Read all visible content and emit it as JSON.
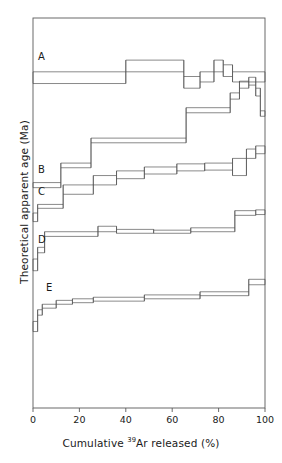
{
  "figure": {
    "title": "",
    "background": "#ffffff",
    "line_color": "#4a4a4a",
    "frame_color": "#5a5a5a"
  },
  "axes": {
    "x": {
      "label_prefix": "Cumulative ",
      "label_sup": "39",
      "label_suffix": "Ar released (%)",
      "label_full": "Cumulative 39Ar released (%)",
      "ticks": [
        "0",
        "20",
        "40",
        "60",
        "80",
        "100"
      ],
      "min": 0,
      "max": 100
    },
    "y": {
      "label": "Theoretical apparent age (Ma)",
      "ticks": [],
      "min": 0,
      "max": 1
    }
  },
  "spectrum_labels": [
    {
      "id": "A",
      "label": "A"
    },
    {
      "id": "B",
      "label": "B"
    },
    {
      "id": "C",
      "label": "C"
    },
    {
      "id": "D",
      "label": "D"
    },
    {
      "id": "E",
      "label": "E"
    }
  ],
  "chart_data": {
    "type": "line",
    "subtype": "ar-ar-age-spectrum-staircase",
    "title": "",
    "xlabel": "Cumulative 39Ar released (%)",
    "ylabel": "Theoretical apparent age (Ma)",
    "xlim": [
      0,
      100
    ],
    "ylim": [
      0,
      1
    ],
    "grid": false,
    "legend": "none",
    "annotations": [
      "A",
      "B",
      "C",
      "D",
      "E"
    ],
    "note": "Five theoretical staircase release spectra; each step drawn as a box with upper and lower error bounds. y values are normalized fractions of the plot height (0 = bottom axis, 1 = top axis).",
    "series": [
      {
        "name": "A",
        "label": "A",
        "steps": [
          {
            "x0": 0,
            "x1": 40,
            "y_low": 0.832,
            "y_high": 0.862
          },
          {
            "x0": 40,
            "x1": 65,
            "y_low": 0.862,
            "y_high": 0.892
          },
          {
            "x0": 65,
            "x1": 72,
            "y_low": 0.82,
            "y_high": 0.85
          },
          {
            "x0": 72,
            "x1": 78,
            "y_low": 0.836,
            "y_high": 0.862
          },
          {
            "x0": 78,
            "x1": 82,
            "y_low": 0.862,
            "y_high": 0.892
          },
          {
            "x0": 82,
            "x1": 86,
            "y_low": 0.85,
            "y_high": 0.88
          },
          {
            "x0": 86,
            "x1": 100,
            "y_low": 0.836,
            "y_high": 0.862
          }
        ]
      },
      {
        "name": "B",
        "label": "B",
        "steps": [
          {
            "x0": 0,
            "x1": 12,
            "y_low": 0.565,
            "y_high": 0.578
          },
          {
            "x0": 12,
            "x1": 25,
            "y_low": 0.616,
            "y_high": 0.628
          },
          {
            "x0": 25,
            "x1": 66,
            "y_low": 0.68,
            "y_high": 0.692
          },
          {
            "x0": 66,
            "x1": 85,
            "y_low": 0.757,
            "y_high": 0.77
          },
          {
            "x0": 85,
            "x1": 89,
            "y_low": 0.792,
            "y_high": 0.808
          },
          {
            "x0": 89,
            "x1": 93,
            "y_low": 0.82,
            "y_high": 0.838
          },
          {
            "x0": 93,
            "x1": 96,
            "y_low": 0.828,
            "y_high": 0.848
          },
          {
            "x0": 96,
            "x1": 98,
            "y_low": 0.8,
            "y_high": 0.82
          },
          {
            "x0": 98,
            "x1": 100,
            "y_low": 0.748,
            "y_high": 0.762
          }
        ]
      },
      {
        "name": "C",
        "label": "C",
        "steps": [
          {
            "x0": 0,
            "x1": 2,
            "y_low": 0.478,
            "y_high": 0.5
          },
          {
            "x0": 2,
            "x1": 13,
            "y_low": 0.512,
            "y_high": 0.522
          },
          {
            "x0": 13,
            "x1": 26,
            "y_low": 0.548,
            "y_high": 0.572
          },
          {
            "x0": 26,
            "x1": 36,
            "y_low": 0.572,
            "y_high": 0.596
          },
          {
            "x0": 36,
            "x1": 48,
            "y_low": 0.588,
            "y_high": 0.608
          },
          {
            "x0": 48,
            "x1": 62,
            "y_low": 0.6,
            "y_high": 0.618
          },
          {
            "x0": 62,
            "x1": 74,
            "y_low": 0.608,
            "y_high": 0.626
          },
          {
            "x0": 74,
            "x1": 86,
            "y_low": 0.61,
            "y_high": 0.628
          },
          {
            "x0": 86,
            "x1": 92,
            "y_low": 0.596,
            "y_high": 0.64
          },
          {
            "x0": 92,
            "x1": 96,
            "y_low": 0.64,
            "y_high": 0.664
          },
          {
            "x0": 96,
            "x1": 100,
            "y_low": 0.652,
            "y_high": 0.672
          }
        ]
      },
      {
        "name": "D",
        "label": "D",
        "steps": [
          {
            "x0": 0,
            "x1": 2,
            "y_low": 0.352,
            "y_high": 0.382
          },
          {
            "x0": 2,
            "x1": 5,
            "y_low": 0.398,
            "y_high": 0.412
          },
          {
            "x0": 5,
            "x1": 28,
            "y_low": 0.44,
            "y_high": 0.452
          },
          {
            "x0": 28,
            "x1": 36,
            "y_low": 0.452,
            "y_high": 0.466
          },
          {
            "x0": 36,
            "x1": 52,
            "y_low": 0.448,
            "y_high": 0.458
          },
          {
            "x0": 52,
            "x1": 68,
            "y_low": 0.448,
            "y_high": 0.456
          },
          {
            "x0": 68,
            "x1": 87,
            "y_low": 0.452,
            "y_high": 0.462
          },
          {
            "x0": 87,
            "x1": 96,
            "y_low": 0.494,
            "y_high": 0.506
          },
          {
            "x0": 96,
            "x1": 100,
            "y_low": 0.496,
            "y_high": 0.508
          }
        ]
      },
      {
        "name": "E",
        "label": "E",
        "steps": [
          {
            "x0": 0,
            "x1": 2,
            "y_low": 0.196,
            "y_high": 0.222
          },
          {
            "x0": 2,
            "x1": 4,
            "y_low": 0.238,
            "y_high": 0.252
          },
          {
            "x0": 4,
            "x1": 10,
            "y_low": 0.256,
            "y_high": 0.266
          },
          {
            "x0": 10,
            "x1": 17,
            "y_low": 0.266,
            "y_high": 0.276
          },
          {
            "x0": 17,
            "x1": 26,
            "y_low": 0.27,
            "y_high": 0.28
          },
          {
            "x0": 26,
            "x1": 48,
            "y_low": 0.274,
            "y_high": 0.284
          },
          {
            "x0": 48,
            "x1": 72,
            "y_low": 0.28,
            "y_high": 0.29
          },
          {
            "x0": 72,
            "x1": 93,
            "y_low": 0.288,
            "y_high": 0.298
          },
          {
            "x0": 93,
            "x1": 100,
            "y_low": 0.316,
            "y_high": 0.33
          }
        ]
      }
    ]
  }
}
